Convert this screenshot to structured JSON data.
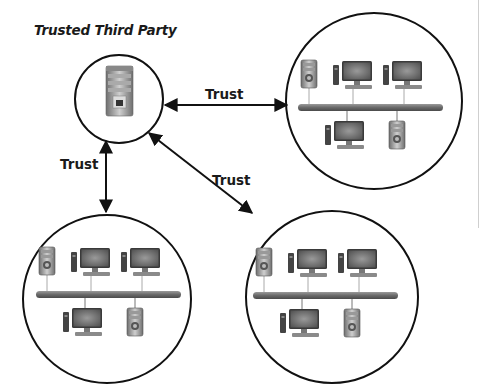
{
  "title": "Trusted Third Party",
  "edges": [
    {
      "id": "ttp-to-network-right",
      "label": "Trust",
      "direction": "bidirectional"
    },
    {
      "id": "ttp-to-network-bottom-left",
      "label": "Trust",
      "direction": "bidirectional"
    },
    {
      "id": "ttp-to-network-bottom-right",
      "label": "Trust",
      "direction": "bidirectional"
    }
  ],
  "nodes": {
    "ttp": {
      "device": "server"
    },
    "networks": [
      {
        "id": "network-top-right",
        "top_devices": [
          "server",
          "desktop",
          "desktop"
        ],
        "bottom_devices": [
          "desktop",
          "server"
        ]
      },
      {
        "id": "network-bottom-left",
        "top_devices": [
          "server",
          "desktop",
          "desktop"
        ],
        "bottom_devices": [
          "desktop",
          "server"
        ]
      },
      {
        "id": "network-bottom-right",
        "top_devices": [
          "server",
          "desktop",
          "desktop"
        ],
        "bottom_devices": [
          "desktop",
          "server"
        ]
      }
    ]
  },
  "colors": {
    "stroke": "#111111",
    "bus": "#6f6f6f",
    "device": "#8a8a8a"
  }
}
